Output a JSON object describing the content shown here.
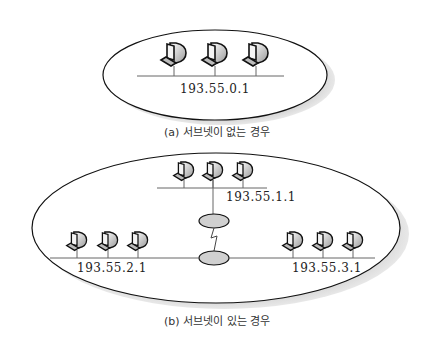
{
  "figure_a": {
    "caption": "(a) 서브넷이 없는 경우",
    "network": {
      "address": "193.55.0.1",
      "hosts": 3
    }
  },
  "figure_b": {
    "caption": "(b) 서브넷이 있는 경우",
    "subnets": [
      {
        "name": "top",
        "address": "193.55.1.1",
        "hosts": 3
      },
      {
        "name": "left",
        "address": "193.55.2.1",
        "hosts": 3
      },
      {
        "name": "right",
        "address": "193.55.3.1",
        "hosts": 3
      }
    ],
    "routers": 2,
    "wan_link": "serial-link"
  },
  "colors": {
    "ellipse_fill": "#ffffff",
    "ellipse_stroke": "#111111",
    "shadow": "#c8c8c8",
    "router_fill": "#d0d0d0",
    "line": "#666666"
  }
}
